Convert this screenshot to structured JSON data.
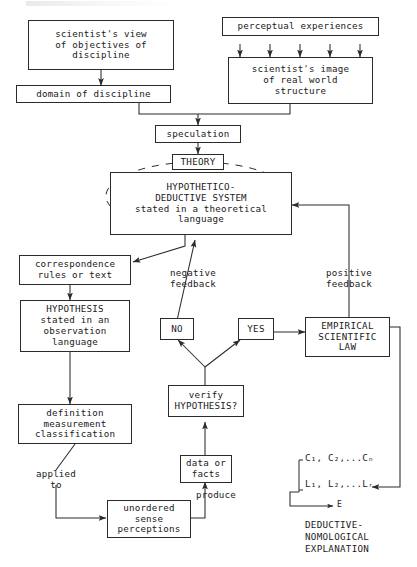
{
  "diagram": {
    "nodes": {
      "scientists_view": "scientist's view\nof objectives of\ndiscipline",
      "domain": "domain of discipline",
      "perceptual": "perceptual experiences",
      "image_real_world": "scientist's image\nof real world\nstructure",
      "speculation": "speculation",
      "theory": "THEORY",
      "hd_system": "HYPOTHETICO-\nDEDUCTIVE SYSTEM\nstated in a theoretical\nlanguage",
      "correspondence": "correspondence\nrules or text",
      "hypothesis": "HYPOTHESIS\nstated in an\nobservation\nlanguage",
      "definition": "definition\nmeasurement\nclassification",
      "no": "NO",
      "yes": "YES",
      "empirical_law": "EMPIRICAL\nSCIENTIFIC\nLAW",
      "verify": "verify\nHYPOTHESIS?",
      "data_facts": "data or\nfacts",
      "unordered": "unordered\nsense\nperceptions"
    },
    "edge_labels": {
      "negative_feedback": "negative\nfeedback",
      "positive_feedback": "positive\nfeedback",
      "applied_to": "applied\nto",
      "produce": "produce"
    },
    "deductive_nomological": {
      "line_c": "C",
      "line_c_rest": ", C",
      "conditions": "C₁, C₂,...Cₙ",
      "laws": "L₁, L₂,...Lᵣ",
      "explanandum": "E",
      "caption": "DEDUCTIVE-\nNOMOLOGICAL\nEXPLANATION"
    },
    "colors": {
      "ink": "#2b2b2b",
      "background": "#ffffff"
    }
  }
}
